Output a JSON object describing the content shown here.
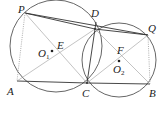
{
  "figure": {
    "type": "two intersecting circles geometry diagram",
    "colors": {
      "stroke": "#333333",
      "background": "#ffffff"
    },
    "circles": [
      {
        "name": "circle-O1",
        "center_label": "O",
        "center_sub": "1"
      },
      {
        "name": "circle-O2",
        "center_label": "O",
        "center_sub": "2"
      }
    ],
    "labels": {
      "P": "P",
      "D": "D",
      "Q": "Q",
      "A": "A",
      "C": "C",
      "B": "B",
      "E": "E",
      "F": "F",
      "O1_main": "O",
      "O1_sub": "1",
      "O2_main": "O",
      "O2_sub": "2"
    },
    "segments": {
      "solid": [
        "PD",
        "PQ",
        "DQ",
        "AC",
        "CB",
        "DC"
      ],
      "thin": [
        "PC",
        "AD",
        "DB",
        "CQ"
      ],
      "dotted": [
        "PA",
        "QB"
      ]
    }
  }
}
